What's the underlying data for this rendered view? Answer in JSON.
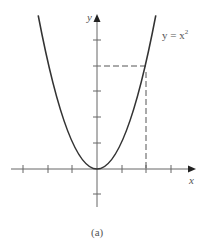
{
  "figure": {
    "caption": "(a)",
    "curve_label": "y = x",
    "curve_label_exponent": "2",
    "x_axis_label": "x",
    "y_axis_label": "y"
  },
  "diagram": {
    "type": "function-graph",
    "function": "y = x^2",
    "x_ticks": [
      -3,
      -2,
      -1,
      1,
      2,
      3
    ],
    "y_ticks": [
      -1,
      1,
      2,
      3,
      4,
      5
    ],
    "highlighted_point": {
      "x": 2,
      "y": 4
    },
    "colors": {
      "axis": "#666666",
      "curve": "#333333",
      "dashed": "#555555",
      "text": "#555555"
    }
  }
}
